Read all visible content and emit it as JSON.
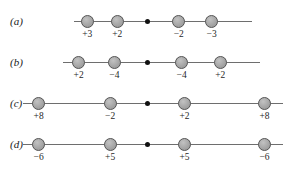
{
  "figure": {
    "background_color": "#ffffff",
    "charge_fill_color": "#a8a8a8",
    "charge_stroke_color": "#575757",
    "axis_color": "#6e6e6e",
    "center_dot_color": "#111111"
  },
  "rows": [
    {
      "label": "(a)",
      "axis_start_pct": 26.0,
      "axis_end_pct": 88.0,
      "center_pct": 51.5,
      "center_dot_name": "center-point-a",
      "charges": [
        {
          "label": "+3",
          "x_pct": 30.5,
          "sign": "positive"
        },
        {
          "label": "+2",
          "x_pct": 41.0,
          "sign": "positive"
        },
        {
          "label": "−2",
          "x_pct": 62.5,
          "sign": "negative"
        },
        {
          "label": "−3",
          "x_pct": 74.0,
          "sign": "negative"
        }
      ]
    },
    {
      "label": "(b)",
      "axis_start_pct": 22.0,
      "axis_end_pct": 91.0,
      "center_pct": 51.5,
      "center_dot_name": "center-point-b",
      "charges": [
        {
          "label": "+2",
          "x_pct": 27.5,
          "sign": "positive"
        },
        {
          "label": "−4",
          "x_pct": 40.0,
          "sign": "negative"
        },
        {
          "label": "−4",
          "x_pct": 63.5,
          "sign": "negative"
        },
        {
          "label": "+2",
          "x_pct": 77.0,
          "sign": "positive"
        }
      ]
    },
    {
      "label": "(c)",
      "axis_start_pct": 8.0,
      "axis_end_pct": 99.0,
      "center_pct": 51.5,
      "center_dot_name": "center-point-c",
      "charges": [
        {
          "label": "+8",
          "x_pct": 13.5,
          "sign": "positive"
        },
        {
          "label": "−2",
          "x_pct": 38.5,
          "sign": "negative"
        },
        {
          "label": "+2",
          "x_pct": 64.5,
          "sign": "positive"
        },
        {
          "label": "+8",
          "x_pct": 92.5,
          "sign": "positive"
        }
      ]
    },
    {
      "label": "(d)",
      "axis_start_pct": 8.0,
      "axis_end_pct": 99.0,
      "center_pct": 51.5,
      "center_dot_name": "center-point-d",
      "charges": [
        {
          "label": "−6",
          "x_pct": 13.5,
          "sign": "negative"
        },
        {
          "label": "+5",
          "x_pct": 38.5,
          "sign": "positive"
        },
        {
          "label": "+5",
          "x_pct": 64.5,
          "sign": "positive"
        },
        {
          "label": "−6",
          "x_pct": 92.5,
          "sign": "negative"
        }
      ]
    }
  ]
}
